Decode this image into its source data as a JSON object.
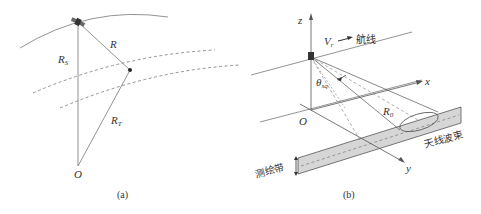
{
  "panel_a": {
    "caption": "(a)",
    "labels": {
      "R": "R",
      "RS_main": "R",
      "RS_sub": "S",
      "RT_main": "R",
      "RT_sub": "T",
      "O": "O"
    }
  },
  "panel_b": {
    "caption": "(b)",
    "labels": {
      "z": "z",
      "x": "x",
      "y": "y",
      "O": "O",
      "V_main": "V",
      "V_sub": "r",
      "flight_line": "航线",
      "theta_main": "θ",
      "theta_sub": "sq",
      "R0_main": "R",
      "R0_sub": "0",
      "antenna_beam": "天线波束",
      "swath": "测绘带"
    }
  },
  "colors": {
    "line": "#555555",
    "swath_fill": "#d6d6d6",
    "text": "#333333"
  }
}
